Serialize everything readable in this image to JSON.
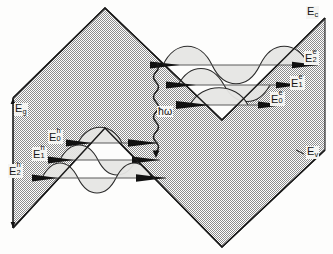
{
  "figure": {
    "kind": "quantum-well-band-diagram",
    "background_color": "#fdfdfc",
    "band_fill_color": "#a8a8a8",
    "band_fill_pattern": "checkerboard-dither",
    "outline_color": "#1a1a1a",
    "wavefunction_fill_color": "#e3e3e1",
    "level_line_color": "#4a4a4a"
  },
  "labels": {
    "band_gap": {
      "base": "E",
      "sub": "g",
      "sup": "",
      "x": 18,
      "y": 110
    },
    "conduction_band_edge": {
      "base": "E",
      "sub": "c",
      "sup": "",
      "x": 307,
      "y": 12
    },
    "valence_band_edge": {
      "base": "E",
      "sub": "v",
      "sup": "",
      "x": 307,
      "y": 152
    },
    "photon": {
      "text": "ħω",
      "x": 158,
      "y": 114
    },
    "electron_levels": [
      {
        "base": "E",
        "sub": "2",
        "sup": "e",
        "x": 306,
        "y": 57,
        "level_index": 2
      },
      {
        "base": "E",
        "sub": "1",
        "sup": "e",
        "x": 292,
        "y": 82,
        "level_index": 1
      },
      {
        "base": "E",
        "sub": "0",
        "sup": "e",
        "x": 272,
        "y": 98,
        "level_index": 0
      }
    ],
    "hole_levels": [
      {
        "base": "E",
        "sub": "0",
        "sup": "h",
        "x": 50,
        "y": 136,
        "level_index": 0
      },
      {
        "base": "E",
        "sub": "1",
        "sup": "h",
        "x": 34,
        "y": 153,
        "level_index": 1
      },
      {
        "base": "E",
        "sub": "2",
        "sup": "h",
        "x": 10,
        "y": 170,
        "level_index": 2
      }
    ]
  },
  "geometry": {
    "conduction_band_path": "M 13,98 L 105,8 L 222,120 L 325,18",
    "valence_band_path": "M 13,228 L 105,128 L 222,247 L 325,150",
    "electron_well_levels_y": [
      105,
      85,
      65
    ],
    "hole_well_levels_y": [
      143,
      160,
      178
    ],
    "photon_arrow": {
      "x": 156,
      "y_top": 62,
      "y_bottom": 155,
      "style": "wavy"
    }
  }
}
